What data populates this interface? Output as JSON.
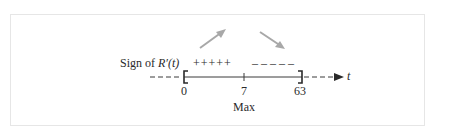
{
  "diagram": {
    "sign_label_prefix": "Sign of ",
    "sign_label_func": "R′(t)",
    "plus_signs": "+++++",
    "minus_signs": "– – – – –",
    "axis_variable": "t",
    "ticks": [
      {
        "value": "0"
      },
      {
        "value": "7"
      },
      {
        "value": "63"
      }
    ],
    "critical_label": "Max",
    "colors": {
      "arrow": "#a8a8a8",
      "axis": "#3a3a3a",
      "frame": "#e6e6e6"
    }
  }
}
